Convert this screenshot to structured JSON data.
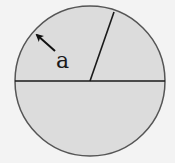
{
  "diagram": {
    "type": "circle-geometry",
    "background_color": "#f3f3f3",
    "circle": {
      "center": [
        90,
        81
      ],
      "radius": 75,
      "fill_color": "#dcdcdc",
      "stroke_color": "#555555"
    },
    "diameter": {
      "from": [
        15,
        81
      ],
      "to": [
        165,
        81
      ],
      "color": "#1a1a1a"
    },
    "radius_line": {
      "from": [
        90,
        81
      ],
      "to": [
        114,
        12
      ],
      "color": "#1a1a1a"
    },
    "arrow": {
      "tail": [
        55,
        51
      ],
      "head": [
        35,
        33
      ],
      "color": "#111111"
    },
    "label": {
      "text": "a",
      "position": [
        56,
        68
      ]
    }
  }
}
